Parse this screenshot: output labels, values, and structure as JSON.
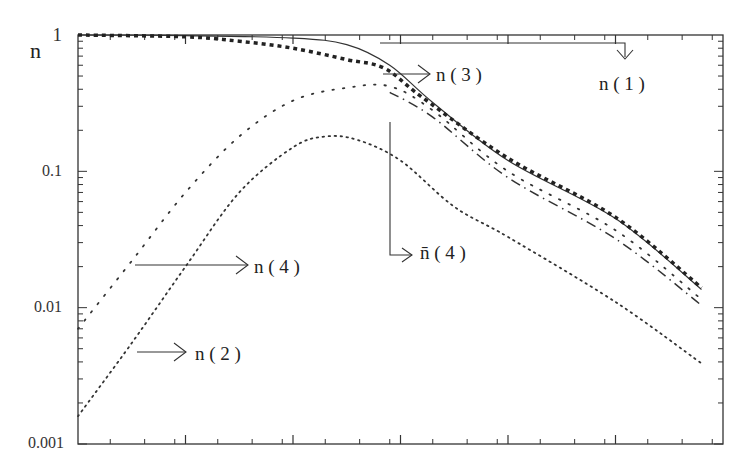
{
  "chart_data": {
    "type": "line",
    "title": "",
    "xlabel": "",
    "ylabel": "n",
    "yscale": "log",
    "ylim": [
      0.001,
      1
    ],
    "xlim": [
      0,
      6
    ],
    "x_major_ticks": [
      0,
      1,
      2,
      3,
      4,
      5,
      6
    ],
    "x_tick_labels": [],
    "y_tick_labels": [
      "1",
      "0.1",
      "0.01",
      "0.001"
    ],
    "y_tick_values": [
      1,
      0.1,
      0.01,
      0.001
    ],
    "grid": false,
    "legend": "inline arrow annotations",
    "series": [
      {
        "name": "n(1)",
        "style": "solid",
        "x": [
          0,
          1,
          2,
          2.5,
          2.9,
          3.3,
          4,
          5,
          5.8
        ],
        "values": [
          1,
          0.99,
          0.95,
          0.85,
          0.6,
          0.32,
          0.12,
          0.045,
          0.0136
        ]
      },
      {
        "name": "n(3)",
        "style": "thick-dotted",
        "x": [
          0,
          1,
          1.5,
          2,
          2.5,
          2.85,
          3.2,
          4,
          5,
          5.8
        ],
        "values": [
          1,
          0.97,
          0.9,
          0.8,
          0.66,
          0.57,
          0.35,
          0.125,
          0.046,
          0.014
        ]
      },
      {
        "name": "n(4)",
        "style": "sparse-dotted",
        "x": [
          0,
          0.5,
          1,
          1.5,
          2,
          2.5,
          2.9,
          3.3,
          4,
          5,
          5.8
        ],
        "values": [
          0.007,
          0.022,
          0.07,
          0.18,
          0.33,
          0.41,
          0.42,
          0.28,
          0.1,
          0.037,
          0.0115
        ]
      },
      {
        "name": "n̄(4)",
        "style": "dashed",
        "x": [
          2.9,
          3.3,
          4,
          5,
          5.8
        ],
        "values": [
          0.38,
          0.25,
          0.09,
          0.032,
          0.0104
        ]
      },
      {
        "name": "n(2)",
        "style": "dotted",
        "x": [
          0,
          0.5,
          1,
          1.5,
          2,
          2.3,
          2.6,
          3,
          3.5,
          4,
          5,
          5.8
        ],
        "values": [
          0.0016,
          0.0055,
          0.02,
          0.07,
          0.15,
          0.18,
          0.17,
          0.12,
          0.055,
          0.033,
          0.011,
          0.0039
        ]
      }
    ],
    "annotations": [
      {
        "text": "n ( 1 )",
        "target": "n(1)"
      },
      {
        "text": "n ( 3 )",
        "target": "n(3)"
      },
      {
        "text": "n ( 4 )",
        "target": "n(4)"
      },
      {
        "text": "n̄ ( 4 )",
        "target": "n̄(4)"
      },
      {
        "text": "n ( 2 )",
        "target": "n(2)"
      }
    ]
  },
  "labels": {
    "ylabel": "n",
    "n1": "n ( 1 )",
    "n3": "n ( 3 )",
    "n4": "n ( 4 )",
    "n4bar": "n̄ ( 4 )",
    "n2": "n ( 2 )",
    "y1": "1",
    "y01": "0.1",
    "y001": "0.01",
    "y0001": "0.001"
  }
}
